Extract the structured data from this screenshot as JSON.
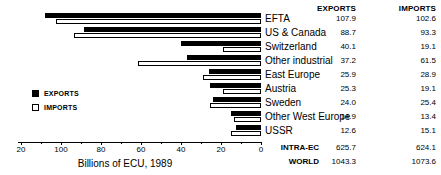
{
  "header": {
    "exports": "EXPORTS",
    "imports": "IMPORTS"
  },
  "legend": {
    "exports_label": "EXPORTS",
    "imports_label": "IMPORTS"
  },
  "axis": {
    "title": "Billions of ECU, 1989",
    "ticks": [
      "20",
      "100",
      "80",
      "60",
      "40",
      "20",
      "0"
    ]
  },
  "totals": [
    {
      "label": "INTRA-EC",
      "exports": "625.7",
      "imports": "624.1"
    },
    {
      "label": "WORLD",
      "exports": "1043.3",
      "imports": "1073.6"
    }
  ],
  "chart_data": {
    "type": "bar",
    "title": "",
    "subtitle": "",
    "xlabel": "Billions of ECU, 1989",
    "ylabel": "",
    "orientation": "horizontal",
    "direction": "right-to-left",
    "xlim": [
      120,
      0
    ],
    "grid": false,
    "legend_position": "inner-left",
    "categories": [
      "EFTA",
      "US & Canada",
      "Switzerland",
      "Other industrial",
      "East Europe",
      "Austria",
      "Sweden",
      "Other West Europe",
      "USSR"
    ],
    "series": [
      {
        "name": "EXPORTS",
        "color": "#000000",
        "values": [
          107.9,
          88.7,
          40.1,
          37.2,
          25.9,
          25.3,
          24.0,
          14.9,
          12.6
        ]
      },
      {
        "name": "IMPORTS",
        "color": "#ffffff",
        "values": [
          102.6,
          93.3,
          19.1,
          61.5,
          28.9,
          19.1,
          25.4,
          13.4,
          15.1
        ]
      }
    ],
    "value_labels": {
      "EFTA": {
        "exports": "107.9",
        "imports": "102.6"
      },
      "US & Canada": {
        "exports": "88.7",
        "imports": "93.3"
      },
      "Switzerland": {
        "exports": "40.1",
        "imports": "19.1"
      },
      "Other industrial": {
        "exports": "37.2",
        "imports": "61.5"
      },
      "East Europe": {
        "exports": "25.9",
        "imports": "28.9"
      },
      "Austria": {
        "exports": "25.3",
        "imports": "19.1"
      },
      "Sweden": {
        "exports": "24.0",
        "imports": "25.4"
      },
      "Other West Europe": {
        "exports": "14.9",
        "imports": "13.4"
      },
      "USSR": {
        "exports": "12.6",
        "imports": "15.1"
      }
    },
    "annotations": [
      {
        "label": "INTRA-EC",
        "exports": 625.7,
        "imports": 624.1
      },
      {
        "label": "WORLD",
        "exports": 1043.3,
        "imports": 1073.6
      }
    ]
  }
}
